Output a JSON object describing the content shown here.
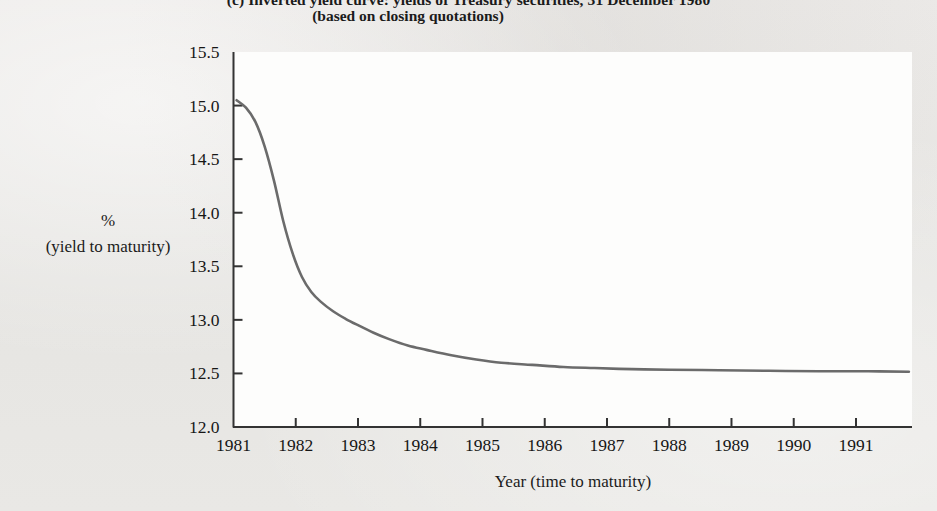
{
  "figure": {
    "title": "(c)  Inverted yield curve: yields of Treasury securities, 31 December 1980",
    "subtitle": "(based on closing quotations)",
    "ylabel_line1": "%",
    "ylabel_line2": "(yield to maturity)",
    "xlabel": "Year (time to maturity)",
    "curve_color": "#6b6b6b",
    "axis_color": "#333333",
    "plot_background": "#fdfdfc",
    "page_background": "#e8e7e5"
  },
  "chart_data": {
    "type": "line",
    "title": "(c)  Inverted yield curve: yields of Treasury securities, 31 December 1980",
    "subtitle": "(based on closing quotations)",
    "xlabel": "Year (time to maturity)",
    "ylabel": "% (yield to maturity)",
    "xlim": [
      1981,
      1991.9
    ],
    "ylim": [
      12.0,
      15.5
    ],
    "grid": false,
    "legend": null,
    "xticks": [
      1981,
      1982,
      1983,
      1984,
      1985,
      1986,
      1987,
      1988,
      1989,
      1990,
      1991
    ],
    "xtick_labels": [
      "1981",
      "1982",
      "1983",
      "1984",
      "1985",
      "1986",
      "1987",
      "1988",
      "1989",
      "1990",
      "1991"
    ],
    "yticks": [
      12.0,
      12.5,
      13.0,
      13.5,
      14.0,
      14.5,
      15.0,
      15.5
    ],
    "ytick_labels": [
      "12.0",
      "12.5",
      "13.0",
      "13.5",
      "14.0",
      "14.5",
      "15.0",
      "15.5"
    ],
    "series": [
      {
        "name": "Treasury yield curve",
        "color": "#6b6b6b",
        "x": [
          1981.05,
          1981.2,
          1981.35,
          1981.5,
          1981.65,
          1981.8,
          1981.95,
          1982.1,
          1982.25,
          1982.4,
          1982.6,
          1982.8,
          1983.0,
          1983.25,
          1983.5,
          1983.8,
          1984.1,
          1984.5,
          1984.9,
          1985.3,
          1985.8,
          1986.3,
          1986.8,
          1987.4,
          1988.0,
          1988.8,
          1989.6,
          1990.4,
          1991.2,
          1991.85
        ],
        "y": [
          15.05,
          14.98,
          14.85,
          14.62,
          14.3,
          13.92,
          13.62,
          13.4,
          13.26,
          13.17,
          13.08,
          13.01,
          12.95,
          12.88,
          12.82,
          12.76,
          12.72,
          12.67,
          12.63,
          12.6,
          12.58,
          12.56,
          12.55,
          12.54,
          12.535,
          12.53,
          12.525,
          12.52,
          12.52,
          12.515
        ]
      }
    ]
  }
}
